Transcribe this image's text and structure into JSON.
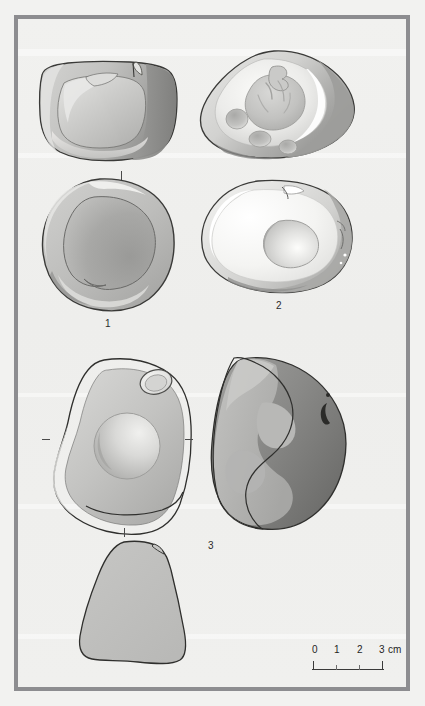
{
  "plate": {
    "kind": "archaeological-artifact-plate",
    "background_color": "#eff0ee",
    "frame_color": "#8d8d90",
    "ink_color": "#2b2b2b"
  },
  "figures": [
    {
      "id": "fig-1-profile",
      "caption": "",
      "description": "Ground stone artifact, side/profile view with concave hollow",
      "fill_light": "#c9c9c7",
      "fill_mid": "#b0b0ae",
      "fill_dark": "#8e8e8c",
      "outline": "#3a3a38"
    },
    {
      "id": "fig-2-oblique",
      "caption": "",
      "description": "Ground stone artifact, oblique view with cup-marks and pecked hollows",
      "fill_light": "#f2f2f0",
      "fill_mid": "#c7c7c5",
      "fill_dark": "#9a9a98",
      "outline": "#3a3a38"
    },
    {
      "id": "fig-1-plan",
      "caption": "1",
      "description": "Ground stone artifact no. 1, plan view with broad shallow depression",
      "fill_light": "#c4c4c2",
      "fill_mid": "#aeaeac",
      "fill_dark": "#949492",
      "outline": "#3a3a38"
    },
    {
      "id": "fig-2-plan",
      "caption": "2",
      "description": "Ground stone artifact no. 2, plan view with central polished hollow",
      "fill_light": "#fbfbf9",
      "fill_mid": "#dedede",
      "fill_dark": "#a8a8a6",
      "outline": "#3a3a38"
    },
    {
      "id": "fig-3-plan",
      "caption": "",
      "description": "Ground stone artifact no. 3, plan view with central round cup-mark and small side hollow",
      "fill_light": "#cfcfcd",
      "fill_mid": "#bbbbb9",
      "fill_dark": "#a0a09e",
      "outline": "#2f2f2d"
    },
    {
      "id": "fig-3-section",
      "caption": "3",
      "description": "Ground stone artifact no. 3, dark shaded side view",
      "fill_light": "#b4b4b2",
      "fill_mid": "#9a9a98",
      "fill_dark": "#6f6f6d",
      "outline": "#2f2f2d"
    },
    {
      "id": "fig-3-profile",
      "caption": "",
      "description": "Ground stone artifact no. 3, plain outline profile view",
      "fill_light": "#c3c3c1",
      "fill_mid": "#bdbdbb",
      "fill_dark": "#b5b5b3",
      "outline": "#2f2f2d"
    }
  ],
  "captions": {
    "one": "1",
    "two": "2",
    "three": "3"
  },
  "scalebar": {
    "ticks": [
      "0",
      "1",
      "2",
      "3"
    ],
    "unit": "cm",
    "label_full": "0 1 2 3 cm"
  }
}
